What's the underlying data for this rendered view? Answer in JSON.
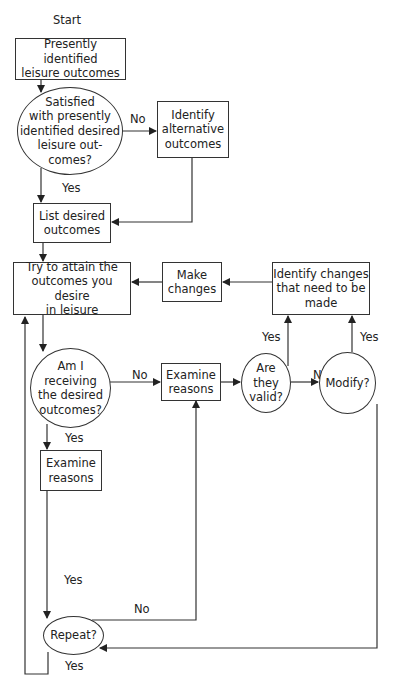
{
  "start_label": "Start",
  "nodes": {
    "present_outcomes": "Presently identified\nleisure outcomes",
    "satisfied_q": "Satisfied\nwith presently\nidentified desired\nleisure out-\ncomes?",
    "identify_alternative": "Identify\nalternative\noutcomes",
    "list_desired": "List desired\noutcomes",
    "try_attain": "Try to attain the\noutcomes you desire\nin leisure",
    "make_changes": "Make\nchanges",
    "identify_changes": "Identify changes\nthat need to be\nmade",
    "receiving_q": "Am I\nreceiving\nthe desired\noutcomes?",
    "examine_reasons_no": "Examine\nreasons",
    "valid_q": "Are\nthey\nvalid?",
    "modify_q": "Modify?",
    "examine_reasons_yes": "Examine\nreasons",
    "repeat_q": "Repeat?"
  },
  "edge_labels": {
    "satisfied_no": "No",
    "satisfied_yes": "Yes",
    "receiving_no": "No",
    "receiving_yes": "Yes",
    "valid_yes": "Yes",
    "valid_no": "No",
    "modify_yes": "Yes",
    "to_repeat_yes": "Yes",
    "repeat_no": "No",
    "repeat_yes": "Yes"
  },
  "colors": {
    "line": "#333333",
    "text": "#222222",
    "background": "#ffffff"
  }
}
